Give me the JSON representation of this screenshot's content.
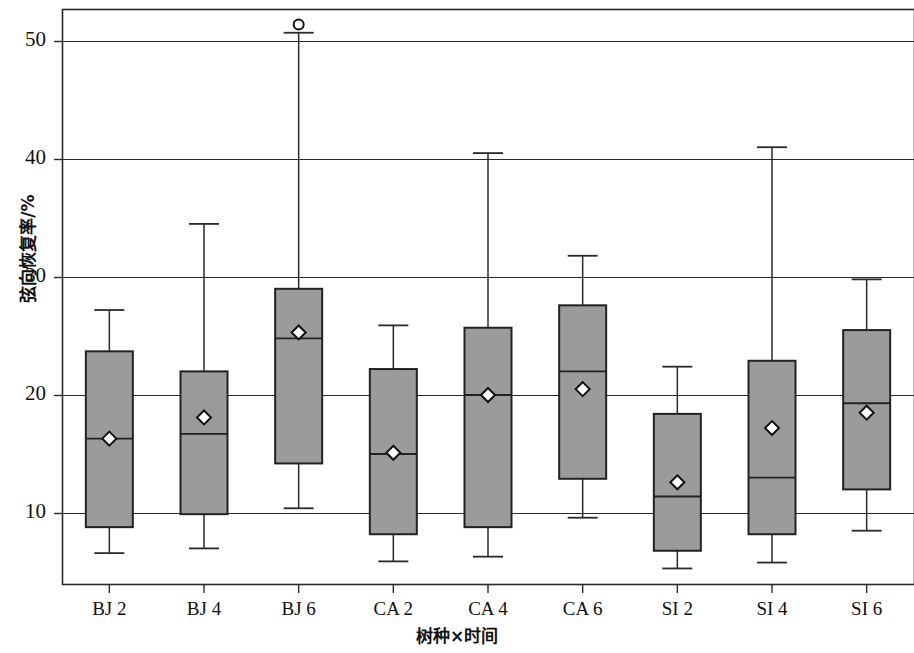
{
  "chart_data": {
    "type": "box",
    "title": "",
    "xlabel": "树种×时间",
    "ylabel": "弦向恢复率/%",
    "ylim": [
      3.8,
      53.5
    ],
    "yticks": [
      10,
      20,
      30,
      40,
      50
    ],
    "ytick_labels": [
      "10",
      "20",
      "30",
      "40",
      "50"
    ],
    "grid": true,
    "grid_axis": "y",
    "legend": "none",
    "categories": [
      "BJ 2",
      "BJ 4",
      "BJ 6",
      "CA 2",
      "CA 4",
      "CA 6",
      "SI 2",
      "SI 4",
      "SI 6"
    ],
    "box_fill_color": "#9b9b9b",
    "box_edge_color": "#222222",
    "mean_marker": "diamond-white",
    "outlier_marker": "open-circle",
    "boxes": [
      {
        "category": "BJ 2",
        "whisker_low": 6.6,
        "q1": 8.8,
        "median": 16.3,
        "q3": 23.7,
        "whisker_high": 27.2,
        "mean": 16.3,
        "outliers": []
      },
      {
        "category": "BJ 4",
        "whisker_low": 7.0,
        "q1": 9.9,
        "median": 16.7,
        "q3": 22.0,
        "whisker_high": 34.5,
        "mean": 18.1,
        "outliers": []
      },
      {
        "category": "BJ 6",
        "whisker_low": 10.4,
        "q1": 14.2,
        "median": 24.8,
        "q3": 29.0,
        "whisker_high": 50.7,
        "mean": 25.3,
        "outliers": [
          51.4
        ]
      },
      {
        "category": "CA 2",
        "whisker_low": 5.9,
        "q1": 8.2,
        "median": 15.0,
        "q3": 22.2,
        "whisker_high": 25.9,
        "mean": 15.1,
        "outliers": []
      },
      {
        "category": "CA 4",
        "whisker_low": 6.3,
        "q1": 8.8,
        "median": 20.0,
        "q3": 25.7,
        "whisker_high": 40.5,
        "mean": 20.0,
        "outliers": []
      },
      {
        "category": "CA 6",
        "whisker_low": 9.6,
        "q1": 12.9,
        "median": 22.0,
        "q3": 27.6,
        "whisker_high": 31.8,
        "mean": 20.5,
        "outliers": []
      },
      {
        "category": "SI 2",
        "whisker_low": 5.3,
        "q1": 6.8,
        "median": 11.4,
        "q3": 18.4,
        "whisker_high": 22.4,
        "mean": 12.6,
        "outliers": []
      },
      {
        "category": "SI 4",
        "whisker_low": 5.8,
        "q1": 8.2,
        "median": 13.0,
        "q3": 22.9,
        "whisker_high": 41.0,
        "mean": 17.2,
        "outliers": []
      },
      {
        "category": "SI 6",
        "whisker_low": 8.5,
        "q1": 12.0,
        "median": 19.3,
        "q3": 25.5,
        "whisker_high": 29.8,
        "mean": 18.5,
        "outliers": []
      }
    ]
  }
}
